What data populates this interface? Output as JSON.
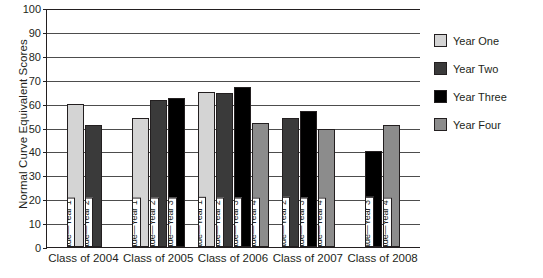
{
  "chart_data": {
    "type": "bar",
    "title": "",
    "xlabel": "",
    "ylabel": "Normal Curve Equivalent Scores",
    "ylim": [
      0,
      100
    ],
    "ytick_step": 10,
    "yticks": [
      0,
      10,
      20,
      30,
      40,
      50,
      60,
      70,
      80,
      90,
      100
    ],
    "grid": true,
    "legend_position": "right",
    "categories": [
      "Class of 2004",
      "Class of 2005",
      "Class of 2006",
      "Class of 2007",
      "Class of 2008"
    ],
    "legend": [
      "Year One",
      "Year Two",
      "Year Three",
      "Year Four"
    ],
    "series": [
      {
        "name": "Year One",
        "values": [
          60,
          54,
          65,
          null,
          null
        ]
      },
      {
        "name": "Year Two",
        "values": [
          51,
          61.5,
          64.5,
          54,
          null
        ]
      },
      {
        "name": "Year Three",
        "values": [
          null,
          62.5,
          67,
          57,
          40
        ]
      },
      {
        "name": "Year Four",
        "values": [
          null,
          null,
          52,
          49.5,
          51
        ]
      }
    ],
    "groups": [
      {
        "category": "Class of 2004",
        "bars": [
          {
            "label": "5th grade—Year 1",
            "value": 60,
            "series": "Year One",
            "swatch": "y1"
          },
          {
            "label": "6th grade—Year 2",
            "value": 51,
            "series": "Year Two",
            "swatch": "y2"
          }
        ]
      },
      {
        "category": "Class of 2005",
        "bars": [
          {
            "label": "4th grade—Year 1",
            "value": 54,
            "series": "Year One",
            "swatch": "y1"
          },
          {
            "label": "5th grade—Year 2",
            "value": 61.5,
            "series": "Year Two",
            "swatch": "y2"
          },
          {
            "label": "6th grade—Year 3",
            "value": 62.5,
            "series": "Year Three",
            "swatch": "y3"
          }
        ]
      },
      {
        "category": "Class of 2006",
        "bars": [
          {
            "label": "3rd grade—Year 1",
            "value": 65,
            "series": "Year One",
            "swatch": "y1"
          },
          {
            "label": "4th grade—Year 2",
            "value": 64.5,
            "series": "Year Two",
            "swatch": "y2"
          },
          {
            "label": "5th grade—Year 3",
            "value": 67,
            "series": "Year Three",
            "swatch": "y3"
          },
          {
            "label": "6th grade—Year 4",
            "value": 52,
            "series": "Year Four",
            "swatch": "y4"
          }
        ]
      },
      {
        "category": "Class of 2007",
        "bars": [
          {
            "label": "3rd grade—Year 2",
            "value": 54,
            "series": "Year Two",
            "swatch": "y2"
          },
          {
            "label": "4th grade—Year 3",
            "value": 57,
            "series": "Year Three",
            "swatch": "y3"
          },
          {
            "label": "5th grade—Year 4",
            "value": 49.5,
            "series": "Year Four",
            "swatch": "y4"
          }
        ]
      },
      {
        "category": "Class of 2008",
        "bars": [
          {
            "label": "3rd grade—Year 3",
            "value": 40,
            "series": "Year Three",
            "swatch": "y3"
          },
          {
            "label": "4th grade—Year 4",
            "value": 51,
            "series": "Year Four",
            "swatch": "y4"
          }
        ]
      }
    ],
    "colors": {
      "year_one": "#d4d4d4",
      "year_two": "#3a3a3a",
      "year_three": "#000000",
      "year_four": "#8c8c8c",
      "axis": "#231f20",
      "gridline": "#4d4d4d",
      "background": "#ffffff"
    }
  }
}
